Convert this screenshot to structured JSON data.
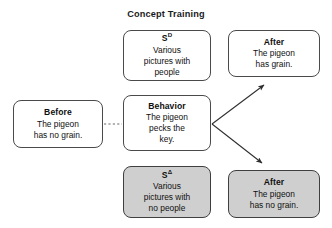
{
  "diagram": {
    "title": "Concept Training",
    "nodes": [
      {
        "id": "sd",
        "heading": "S",
        "superscript": "D",
        "body": "Various\npictures with\npeople",
        "fill": "#ffffff"
      },
      {
        "id": "before",
        "heading": "Before",
        "superscript": "",
        "body": "The pigeon\nhas no grain.",
        "fill": "#ffffff"
      },
      {
        "id": "behavior",
        "heading": "Behavior",
        "superscript": "",
        "body": "The pigeon\npecks the\nkey.",
        "fill": "#ffffff"
      },
      {
        "id": "sdelta",
        "heading": "S",
        "superscript": "Δ",
        "body": "Various\npictures with\nno people",
        "fill": "#cfcfcf"
      },
      {
        "id": "after_top",
        "heading": "After",
        "superscript": "",
        "body": "The pigeon\nhas grain.",
        "fill": "#ffffff"
      },
      {
        "id": "after_bottom",
        "heading": "After",
        "superscript": "",
        "body": "The pigeon\nhas no grain.",
        "fill": "#cfcfcf"
      }
    ],
    "connectors": [
      {
        "id": "before_to_behavior",
        "style": "dotted",
        "arrowhead": "none",
        "from": "before",
        "to": "behavior"
      },
      {
        "id": "behavior_to_after_top",
        "style": "solid",
        "arrowhead": "arrow",
        "from": "behavior",
        "to": "after_top"
      },
      {
        "id": "behavior_to_after_bottom",
        "style": "solid",
        "arrowhead": "arrow",
        "from": "behavior",
        "to": "after_bottom"
      }
    ],
    "colors": {
      "shaded_fill": "#cfcfcf",
      "plain_fill": "#ffffff",
      "stroke": "#4a4a4a",
      "text": "#101010"
    }
  }
}
